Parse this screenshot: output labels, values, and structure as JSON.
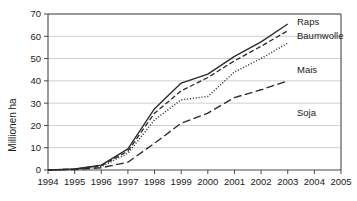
{
  "chart_data": {
    "type": "line",
    "title": "",
    "xlabel": "",
    "ylabel": "Millionen ha",
    "xlim": [
      1994,
      2005
    ],
    "ylim": [
      0,
      70
    ],
    "grid": true,
    "legend_position": "right-inline",
    "x": [
      1994,
      1995,
      1996,
      1997,
      1998,
      1999,
      2000,
      2001,
      2002,
      2003
    ],
    "xticks": [
      "1994",
      "1995",
      "1996",
      "1997",
      "1998",
      "1999",
      "2000",
      "2001",
      "2002",
      "2003",
      "2004",
      "2005"
    ],
    "yticks": [
      "0",
      "10",
      "20",
      "30",
      "40",
      "50",
      "60",
      "70"
    ],
    "series": [
      {
        "name": "Raps",
        "label": "Raps",
        "style": "solid",
        "color": "#2b2b2b",
        "values": [
          0,
          0.5,
          2.2,
          9.5,
          27.5,
          39.0,
          43.0,
          51.0,
          57.5,
          65.5
        ]
      },
      {
        "name": "Baumwolle",
        "label": "Baumwolle",
        "style": "dashed",
        "color": "#2b2b2b",
        "values": [
          0,
          0.4,
          1.9,
          8.5,
          25.5,
          35.5,
          41.5,
          49.0,
          55.5,
          62.5
        ]
      },
      {
        "name": "Mais",
        "label": "Mais",
        "style": "dotted",
        "color": "#8c8c8c",
        "values": [
          0,
          0.3,
          1.5,
          7.5,
          22.5,
          31.5,
          33.0,
          44.0,
          50.0,
          57.0
        ]
      },
      {
        "name": "Soja",
        "label": "Soja",
        "style": "longdash",
        "color": "#2b2b2b",
        "values": [
          0,
          0.2,
          1.0,
          3.5,
          12.0,
          21.0,
          25.5,
          32.5,
          36.0,
          40.0
        ]
      }
    ],
    "annotations": [
      {
        "text": "Raps",
        "x_px": 297,
        "y_px": 25
      },
      {
        "text": "Baumwolle",
        "x_px": 297,
        "y_px": 39
      },
      {
        "text": "Mais",
        "x_px": 297,
        "y_px": 73
      },
      {
        "text": "Soja",
        "x_px": 297,
        "y_px": 116
      }
    ]
  }
}
